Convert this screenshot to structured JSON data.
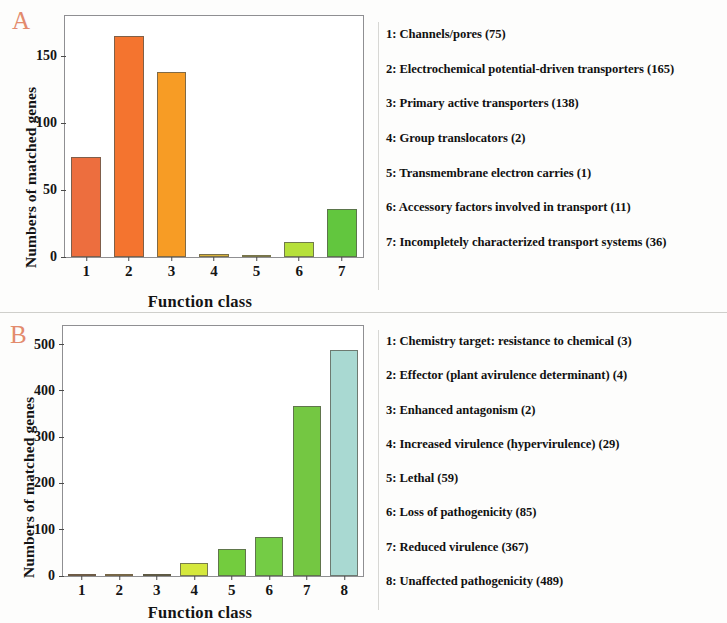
{
  "figure": {
    "panel_a_letter": "A",
    "panel_b_letter": "B"
  },
  "chart_data": [
    {
      "panel": "A",
      "type": "bar",
      "title": "",
      "xlabel": "Function class",
      "ylabel": "Numbers of matched genes",
      "categories": [
        "1",
        "2",
        "3",
        "4",
        "5",
        "6",
        "7"
      ],
      "values": [
        75,
        165,
        138,
        2,
        1,
        11,
        36
      ],
      "ylim": [
        0,
        180
      ],
      "yticks": [
        0,
        50,
        100,
        150
      ],
      "ytick_labels": [
        "0",
        "50",
        "100",
        "150"
      ],
      "grid": false,
      "legend_position": "right",
      "colors": [
        "#ED6E3E",
        "#F4742F",
        "#F79C25",
        "#D9B23A",
        "#D4C63F",
        "#B6E03A",
        "#62C63E"
      ],
      "legend": [
        "1: Channels/pores (75)",
        "2: Electrochemical potential-driven transporters (165)",
        "3: Primary active transporters (138)",
        "4: Group translocators (2)",
        "5: Transmembrane electron carries (1)",
        "6: Accessory factors involved in transport (11)",
        "7: Incompletely characterized transport systems (36)"
      ]
    },
    {
      "panel": "B",
      "type": "bar",
      "title": "",
      "xlabel": "Function class",
      "ylabel": "Numbers of matched genes",
      "categories": [
        "1",
        "2",
        "3",
        "4",
        "5",
        "6",
        "7",
        "8"
      ],
      "values": [
        3,
        4,
        2,
        29,
        59,
        85,
        367,
        489
      ],
      "ylim": [
        0,
        540
      ],
      "yticks": [
        0,
        100,
        200,
        300,
        400,
        500
      ],
      "ytick_labels": [
        "0",
        "100",
        "200",
        "300",
        "400",
        "500"
      ],
      "grid": false,
      "legend_position": "right",
      "colors": [
        "#A6622A",
        "#C98A2C",
        "#6E5A22",
        "#D5E83C",
        "#73CC3E",
        "#74CC45",
        "#74C742",
        "#A9D9D2"
      ],
      "legend": [
        "1: Chemistry target: resistance to chemical (3)",
        "2: Effector (plant avirulence determinant) (4)",
        "3: Enhanced antagonism (2)",
        "4: Increased virulence (hypervirulence) (29)",
        "5: Lethal (59)",
        "6: Loss of pathogenicity (85)",
        "7: Reduced virulence (367)",
        "8: Unaffected pathogenicity (489)"
      ]
    }
  ]
}
